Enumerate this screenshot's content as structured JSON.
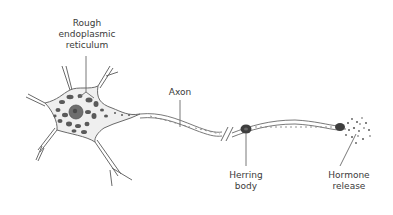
{
  "diagram": {
    "labels": {
      "rough_er": {
        "line1": "Rough",
        "line2": "endoplasmic",
        "line3": "reticulum"
      },
      "axon": {
        "line1": "Axon"
      },
      "herring_body": {
        "line1": "Herring",
        "line2": "body"
      },
      "hormone_release": {
        "line1": "Hormone",
        "line2": "release"
      }
    },
    "colors": {
      "outline": "#6a6a6a",
      "cytoplasm": "#efefef",
      "organelle": "#5a5a5a",
      "nucleus": "#6e6e6e",
      "text": "#3a3a3a"
    }
  }
}
